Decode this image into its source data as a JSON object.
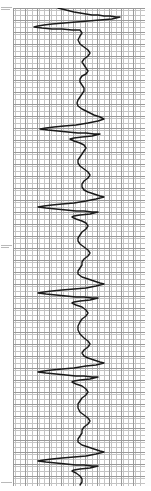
{
  "document": {
    "kind": "strip-chart-recording",
    "orientation": "vertical",
    "paper_color": "#ffffff",
    "trace_color": "#1a1a1a",
    "grid_minor_color": "#c4c4c4",
    "grid_major_color": "#9a9a9a",
    "margin_mark_color": "#b9b9b9"
  },
  "plot_area": {
    "left": 13,
    "top": 8,
    "width": 132,
    "height": 478,
    "minor_cell_px": 2.4,
    "major_cell_px": 12
  },
  "margin_marks": [
    {
      "x": 1,
      "y": 7,
      "width": 11
    },
    {
      "x": 1,
      "y": 9,
      "width": 9
    },
    {
      "x": 1,
      "y": 245,
      "width": 11
    },
    {
      "x": 1,
      "y": 247,
      "width": 8
    },
    {
      "x": 1,
      "y": 482,
      "width": 11
    }
  ],
  "chart_data": {
    "type": "line",
    "title": "",
    "subtitle": "",
    "xlabel": "",
    "ylabel": "",
    "grid": true,
    "legend": null,
    "orientation": "vertical-time-axis",
    "xlim": [
      13,
      145
    ],
    "ylim": [
      8,
      486
    ],
    "baseline_x": 80,
    "series": [
      {
        "name": "recording-trace",
        "color": "#1a1a1a",
        "width": 1.4,
        "points": [
          [
            58,
            8
          ],
          [
            66,
            10
          ],
          [
            74,
            12
          ],
          [
            80,
            13
          ],
          [
            86,
            14
          ],
          [
            92,
            15
          ],
          [
            98,
            15
          ],
          [
            104,
            16
          ],
          [
            110,
            16
          ],
          [
            116,
            17
          ],
          [
            120,
            17
          ],
          [
            112,
            19
          ],
          [
            100,
            20
          ],
          [
            88,
            21
          ],
          [
            76,
            22
          ],
          [
            64,
            23
          ],
          [
            52,
            24
          ],
          [
            44,
            25
          ],
          [
            38,
            26
          ],
          [
            34,
            27
          ],
          [
            42,
            28
          ],
          [
            52,
            29
          ],
          [
            62,
            29
          ],
          [
            72,
            30
          ],
          [
            80,
            30
          ],
          [
            82,
            33
          ],
          [
            80,
            36
          ],
          [
            78,
            40
          ],
          [
            80,
            44
          ],
          [
            84,
            47
          ],
          [
            88,
            50
          ],
          [
            90,
            53
          ],
          [
            88,
            56
          ],
          [
            84,
            59
          ],
          [
            82,
            62
          ],
          [
            84,
            65
          ],
          [
            86,
            68
          ],
          [
            88,
            71
          ],
          [
            86,
            74
          ],
          [
            82,
            76
          ],
          [
            80,
            79
          ],
          [
            80,
            82
          ],
          [
            82,
            85
          ],
          [
            84,
            88
          ],
          [
            84,
            91
          ],
          [
            82,
            94
          ],
          [
            80,
            97
          ],
          [
            78,
            100
          ],
          [
            77,
            103
          ],
          [
            78,
            106
          ],
          [
            82,
            109
          ],
          [
            88,
            112
          ],
          [
            94,
            115
          ],
          [
            100,
            117
          ],
          [
            104,
            119
          ],
          [
            98,
            121
          ],
          [
            88,
            123
          ],
          [
            76,
            125
          ],
          [
            64,
            126
          ],
          [
            54,
            127
          ],
          [
            46,
            128
          ],
          [
            40,
            129
          ],
          [
            48,
            130
          ],
          [
            58,
            131
          ],
          [
            68,
            132
          ],
          [
            78,
            133
          ],
          [
            86,
            133
          ],
          [
            94,
            134
          ],
          [
            100,
            134
          ],
          [
            92,
            136
          ],
          [
            82,
            137
          ],
          [
            74,
            138
          ],
          [
            70,
            139
          ],
          [
            74,
            141
          ],
          [
            80,
            143
          ],
          [
            84,
            145
          ],
          [
            86,
            148
          ],
          [
            84,
            151
          ],
          [
            82,
            154
          ],
          [
            80,
            157
          ],
          [
            78,
            160
          ],
          [
            78,
            163
          ],
          [
            80,
            166
          ],
          [
            84,
            169
          ],
          [
            88,
            172
          ],
          [
            90,
            175
          ],
          [
            88,
            178
          ],
          [
            84,
            181
          ],
          [
            82,
            184
          ],
          [
            82,
            187
          ],
          [
            84,
            190
          ],
          [
            88,
            192
          ],
          [
            94,
            194
          ],
          [
            100,
            196
          ],
          [
            104,
            197
          ],
          [
            96,
            199
          ],
          [
            86,
            201
          ],
          [
            74,
            203
          ],
          [
            62,
            204
          ],
          [
            52,
            205
          ],
          [
            44,
            206
          ],
          [
            38,
            207
          ],
          [
            46,
            208
          ],
          [
            56,
            209
          ],
          [
            66,
            210
          ],
          [
            76,
            211
          ],
          [
            84,
            211
          ],
          [
            92,
            212
          ],
          [
            98,
            212
          ],
          [
            90,
            214
          ],
          [
            80,
            215
          ],
          [
            74,
            216
          ],
          [
            72,
            217
          ],
          [
            76,
            219
          ],
          [
            82,
            221
          ],
          [
            86,
            223
          ],
          [
            88,
            226
          ],
          [
            86,
            229
          ],
          [
            82,
            232
          ],
          [
            80,
            235
          ],
          [
            78,
            238
          ],
          [
            78,
            241
          ],
          [
            80,
            244
          ],
          [
            84,
            247
          ],
          [
            88,
            250
          ],
          [
            90,
            253
          ],
          [
            88,
            256
          ],
          [
            84,
            259
          ],
          [
            82,
            262
          ],
          [
            82,
            265
          ],
          [
            80,
            268
          ],
          [
            78,
            271
          ],
          [
            78,
            274
          ],
          [
            82,
            277
          ],
          [
            88,
            279
          ],
          [
            94,
            281
          ],
          [
            100,
            283
          ],
          [
            104,
            284
          ],
          [
            96,
            286
          ],
          [
            86,
            288
          ],
          [
            74,
            289
          ],
          [
            62,
            290
          ],
          [
            52,
            291
          ],
          [
            44,
            292
          ],
          [
            38,
            293
          ],
          [
            46,
            294
          ],
          [
            56,
            295
          ],
          [
            66,
            296
          ],
          [
            76,
            297
          ],
          [
            84,
            297
          ],
          [
            92,
            298
          ],
          [
            98,
            298
          ],
          [
            90,
            300
          ],
          [
            80,
            301
          ],
          [
            74,
            302
          ],
          [
            72,
            303
          ],
          [
            76,
            305
          ],
          [
            82,
            307
          ],
          [
            86,
            310
          ],
          [
            88,
            313
          ],
          [
            86,
            316
          ],
          [
            82,
            319
          ],
          [
            80,
            322
          ],
          [
            78,
            326
          ],
          [
            78,
            330
          ],
          [
            80,
            334
          ],
          [
            84,
            338
          ],
          [
            88,
            341
          ],
          [
            90,
            344
          ],
          [
            88,
            347
          ],
          [
            84,
            350
          ],
          [
            82,
            353
          ],
          [
            84,
            356
          ],
          [
            88,
            358
          ],
          [
            94,
            360
          ],
          [
            100,
            362
          ],
          [
            104,
            363
          ],
          [
            96,
            365
          ],
          [
            86,
            366
          ],
          [
            74,
            368
          ],
          [
            62,
            369
          ],
          [
            52,
            370
          ],
          [
            44,
            371
          ],
          [
            38,
            372
          ],
          [
            46,
            373
          ],
          [
            56,
            374
          ],
          [
            66,
            375
          ],
          [
            76,
            376
          ],
          [
            84,
            376
          ],
          [
            92,
            377
          ],
          [
            98,
            377
          ],
          [
            90,
            379
          ],
          [
            80,
            380
          ],
          [
            74,
            381
          ],
          [
            72,
            382
          ],
          [
            76,
            384
          ],
          [
            82,
            386
          ],
          [
            86,
            389
          ],
          [
            88,
            392
          ],
          [
            86,
            395
          ],
          [
            82,
            398
          ],
          [
            80,
            401
          ],
          [
            78,
            404
          ],
          [
            78,
            408
          ],
          [
            80,
            412
          ],
          [
            84,
            415
          ],
          [
            88,
            418
          ],
          [
            90,
            421
          ],
          [
            88,
            424
          ],
          [
            84,
            427
          ],
          [
            82,
            430
          ],
          [
            82,
            433
          ],
          [
            80,
            436
          ],
          [
            78,
            439
          ],
          [
            78,
            442
          ],
          [
            82,
            445
          ],
          [
            88,
            447
          ],
          [
            94,
            449
          ],
          [
            100,
            451
          ],
          [
            104,
            452
          ],
          [
            96,
            454
          ],
          [
            86,
            456
          ],
          [
            74,
            457
          ],
          [
            62,
            458
          ],
          [
            52,
            459
          ],
          [
            44,
            460
          ],
          [
            38,
            461
          ],
          [
            46,
            462
          ],
          [
            56,
            463
          ],
          [
            66,
            464
          ],
          [
            76,
            465
          ],
          [
            84,
            465
          ],
          [
            92,
            466
          ],
          [
            98,
            466
          ],
          [
            90,
            468
          ],
          [
            80,
            469
          ],
          [
            74,
            470
          ],
          [
            72,
            471
          ],
          [
            76,
            473
          ],
          [
            80,
            476
          ],
          [
            82,
            479
          ],
          [
            82,
            482
          ],
          [
            80,
            485
          ]
        ]
      }
    ],
    "spike_events": [
      {
        "index": 1,
        "y": 26,
        "extent_left_x": 34,
        "extent_right_x": 120
      },
      {
        "index": 2,
        "y": 128,
        "extent_left_x": 40,
        "extent_right_x": 104
      },
      {
        "index": 3,
        "y": 206,
        "extent_left_x": 38,
        "extent_right_x": 104
      },
      {
        "index": 4,
        "y": 292,
        "extent_left_x": 38,
        "extent_right_x": 104
      },
      {
        "index": 5,
        "y": 371,
        "extent_left_x": 38,
        "extent_right_x": 104
      },
      {
        "index": 6,
        "y": 460,
        "extent_left_x": 38,
        "extent_right_x": 104
      }
    ]
  }
}
